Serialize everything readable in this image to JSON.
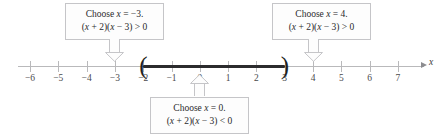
{
  "figure": {
    "kind": "number-line-sign-chart",
    "axis_variable": "x",
    "axis_label": "x",
    "line_color": "#b9b9bb",
    "segment_color": "#2b2b2d",
    "box_border_color": "#c5c5c8",
    "box_fill_color": "#fdfdfd",
    "ticks": [
      {
        "value": -6,
        "label": "−6"
      },
      {
        "value": -5,
        "label": "−5"
      },
      {
        "value": -4,
        "label": "−4"
      },
      {
        "value": -3,
        "label": "−3"
      },
      {
        "value": -2,
        "label": "−2"
      },
      {
        "value": -1,
        "label": "−1"
      },
      {
        "value": 0,
        "label": "0"
      },
      {
        "value": 1,
        "label": "1"
      },
      {
        "value": 2,
        "label": "2"
      },
      {
        "value": 3,
        "label": "3"
      },
      {
        "value": 4,
        "label": "4"
      },
      {
        "value": 5,
        "label": "5"
      },
      {
        "value": 6,
        "label": "6"
      },
      {
        "value": 7,
        "label": "7"
      }
    ],
    "solution_interval": {
      "from": -2,
      "to": 3,
      "left_endpoint": "open",
      "right_endpoint": "open",
      "left_bracket": "(",
      "right_bracket": ")"
    },
    "callouts": [
      {
        "id": "test-point-left",
        "line1_prefix": "Choose ",
        "line1_var": "x",
        "line1_suffix": " = −3.",
        "line2_a": "(",
        "line2_x1": "x",
        "line2_b": " + 2)(",
        "line2_x2": "x",
        "line2_c": " − 3) > 0",
        "points_to": -3,
        "direction": "down"
      },
      {
        "id": "test-point-right",
        "line1_prefix": "Choose ",
        "line1_var": "x",
        "line1_suffix": " = 4.",
        "line2_a": "(",
        "line2_x1": "x",
        "line2_b": " + 2)(",
        "line2_x2": "x",
        "line2_c": " − 3) > 0",
        "points_to": 4,
        "direction": "down"
      },
      {
        "id": "test-point-middle",
        "line1_prefix": "Choose ",
        "line1_var": "x",
        "line1_suffix": " = 0.",
        "line2_a": "(",
        "line2_x1": "x",
        "line2_b": " + 2)(",
        "line2_x2": "x",
        "line2_c": " − 3) < 0",
        "points_to": 0,
        "direction": "up"
      }
    ]
  },
  "chart_data": {
    "type": "line",
    "title": "",
    "xlabel": "x",
    "ylabel": "",
    "xlim": [
      -6.5,
      7.5
    ],
    "grid": false,
    "legend": null,
    "x_ticks": [
      -6,
      -5,
      -4,
      -3,
      -2,
      -1,
      0,
      1,
      2,
      3,
      4,
      5,
      6,
      7
    ],
    "x_tick_labels": [
      "−6",
      "−5",
      "−4",
      "−3",
      "−2",
      "−1",
      "0",
      "1",
      "2",
      "3",
      "4",
      "5",
      "6",
      "7"
    ],
    "series": [
      {
        "name": "solution set of (x + 2)(x − 3) < 0",
        "interval": [
          -2,
          3
        ],
        "endpoints": [
          "open",
          "open"
        ],
        "values": [
          -2,
          3
        ]
      }
    ],
    "annotations": [
      {
        "x": -3,
        "text": "Choose x = −3. (x + 2)(x − 3) > 0",
        "position": "above"
      },
      {
        "x": 0,
        "text": "Choose x = 0. (x + 2)(x − 3) < 0",
        "position": "below"
      },
      {
        "x": 4,
        "text": "Choose x = 4. (x + 2)(x − 3) > 0",
        "position": "above"
      }
    ]
  }
}
